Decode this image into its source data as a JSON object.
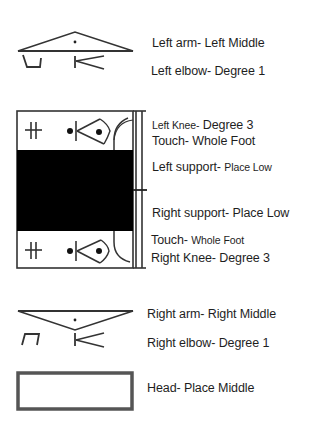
{
  "diagram": {
    "type": "movement-notation",
    "groups": [
      {
        "id": "left-arm",
        "labels": [
          {
            "part": "Left arm-",
            "value": "Left Middle"
          },
          {
            "part": "Left elbow-",
            "value": "Degree 1"
          }
        ]
      },
      {
        "id": "support-staff",
        "labels": [
          {
            "part": "Left Knee-",
            "value": "Degree 3"
          },
          {
            "part": "Touch-",
            "value": "Whole Foot"
          },
          {
            "part": "Left support-",
            "value": "Place Low"
          },
          {
            "part": "Right support-",
            "value": "Place Low"
          },
          {
            "part": "Touch-",
            "value": "Whole Foot"
          },
          {
            "part": "Right Knee-",
            "value": "Degree 3"
          }
        ]
      },
      {
        "id": "right-arm",
        "labels": [
          {
            "part": "Right arm-",
            "value": "Right Middle"
          },
          {
            "part": "Right elbow-",
            "value": "Degree 1"
          }
        ]
      },
      {
        "id": "head",
        "labels": [
          {
            "part": "Head-",
            "value": "Place Middle"
          }
        ]
      }
    ],
    "colors": {
      "stroke": "#333333",
      "fill_support": "#000000",
      "head_box": "#555555",
      "text": "#1e1e1e"
    }
  }
}
